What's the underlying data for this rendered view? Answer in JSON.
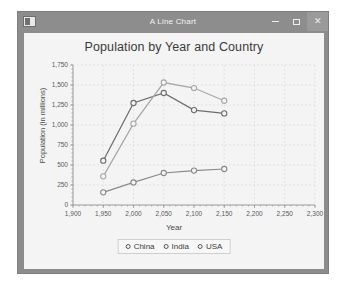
{
  "window": {
    "title": "A Line Chart",
    "app_icon": "window-icon",
    "buttons": {
      "minimize": "minimize-icon",
      "maximize": "maximize-icon",
      "close": "close-icon"
    }
  },
  "chart_data": {
    "type": "line",
    "title": "Population by Year and Country",
    "xlabel": "Year",
    "ylabel": "Population (in millions)",
    "xlim": [
      1900,
      2300
    ],
    "ylim": [
      0,
      1750
    ],
    "xticks": [
      "1,900",
      "1,950",
      "2,000",
      "2,050",
      "2,100",
      "2,150",
      "2,200",
      "2,250",
      "2,300"
    ],
    "xtick_values": [
      1900,
      1950,
      2000,
      2050,
      2100,
      2150,
      2200,
      2250,
      2300
    ],
    "yticks": [
      "0",
      "250",
      "500",
      "750",
      "1,000",
      "1,250",
      "1,500",
      "1,750"
    ],
    "ytick_values": [
      0,
      250,
      500,
      750,
      1000,
      1250,
      1500,
      1750
    ],
    "grid": true,
    "legend_position": "bottom",
    "x": [
      1950,
      2000,
      2050,
      2100,
      2150
    ],
    "series": [
      {
        "name": "China",
        "color": "#6e6e6e",
        "values": [
          554,
          1275,
          1400,
          1186,
          1145
        ]
      },
      {
        "name": "India",
        "color": "#a8a8a8",
        "values": [
          358,
          1017,
          1531,
          1462,
          1303
        ]
      },
      {
        "name": "USA",
        "color": "#8a8a8a",
        "values": [
          158,
          282,
          400,
          430,
          450
        ]
      }
    ]
  },
  "legend": {
    "items": [
      {
        "label": "China"
      },
      {
        "label": "India"
      },
      {
        "label": "USA"
      }
    ]
  },
  "colors": {
    "titlebar": "#8d8d8d",
    "client_bg": "#f4f4f4",
    "grid": "#d8d8d8",
    "axis": "#8e8e8e"
  }
}
